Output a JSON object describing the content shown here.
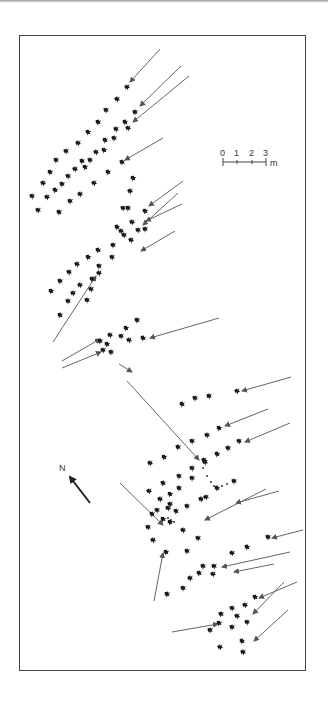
{
  "figure": {
    "type": "trackway-map",
    "colors": {
      "frame": "#444444",
      "track": "#1a1a1a",
      "arrow": "#555555",
      "background": "#ffffff"
    }
  },
  "scale_bar": {
    "ticks": [
      "0",
      "1",
      "2",
      "3"
    ],
    "unit": "m"
  },
  "north_arrow": {
    "label": "N"
  },
  "footprints": [
    [
      127,
      87
    ],
    [
      117,
      99
    ],
    [
      106,
      110
    ],
    [
      98,
      122
    ],
    [
      88,
      132
    ],
    [
      78,
      143
    ],
    [
      66,
      151
    ],
    [
      56,
      160
    ],
    [
      50,
      172
    ],
    [
      43,
      183
    ],
    [
      32,
      196
    ],
    [
      135,
      112
    ],
    [
      125,
      122
    ],
    [
      128,
      128
    ],
    [
      116,
      129
    ],
    [
      114,
      138
    ],
    [
      105,
      140
    ],
    [
      104,
      150
    ],
    [
      96,
      152
    ],
    [
      90,
      160
    ],
    [
      82,
      161
    ],
    [
      85,
      167
    ],
    [
      75,
      169
    ],
    [
      68,
      176
    ],
    [
      62,
      184
    ],
    [
      55,
      190
    ],
    [
      47,
      197
    ],
    [
      38,
      210
    ],
    [
      122,
      162
    ],
    [
      108,
      172
    ],
    [
      94,
      183
    ],
    [
      80,
      194
    ],
    [
      70,
      201
    ],
    [
      59,
      212
    ],
    [
      133,
      178
    ],
    [
      130,
      191
    ],
    [
      123,
      208
    ],
    [
      128,
      208
    ],
    [
      145,
      211
    ],
    [
      132,
      222
    ],
    [
      138,
      230
    ],
    [
      145,
      229
    ],
    [
      117,
      227
    ],
    [
      121,
      231
    ],
    [
      124,
      235
    ],
    [
      113,
      245
    ],
    [
      98,
      250
    ],
    [
      88,
      257
    ],
    [
      77,
      264
    ],
    [
      69,
      272
    ],
    [
      60,
      281
    ],
    [
      51,
      291
    ],
    [
      131,
      240
    ],
    [
      112,
      257
    ],
    [
      99,
      266
    ],
    [
      92,
      279
    ],
    [
      80,
      285
    ],
    [
      73,
      293
    ],
    [
      68,
      301
    ],
    [
      60,
      315
    ],
    [
      99,
      273
    ],
    [
      91,
      289
    ],
    [
      87,
      300
    ],
    [
      137,
      320
    ],
    [
      126,
      328
    ],
    [
      110,
      335
    ],
    [
      121,
      336
    ],
    [
      100,
      341
    ],
    [
      107,
      344
    ],
    [
      129,
      340
    ],
    [
      103,
      350
    ],
    [
      111,
      352
    ],
    [
      143,
      338
    ],
    [
      237,
      391
    ],
    [
      209,
      396
    ],
    [
      195,
      398
    ],
    [
      182,
      404
    ],
    [
      219,
      428
    ],
    [
      207,
      435
    ],
    [
      192,
      441
    ],
    [
      178,
      447
    ],
    [
      164,
      457
    ],
    [
      150,
      463
    ],
    [
      239,
      441
    ],
    [
      228,
      448
    ],
    [
      217,
      454
    ],
    [
      204,
      460
    ],
    [
      192,
      468
    ],
    [
      179,
      476
    ],
    [
      163,
      483
    ],
    [
      149,
      491
    ],
    [
      205,
      462
    ],
    [
      192,
      478
    ],
    [
      179,
      488
    ],
    [
      170,
      494
    ],
    [
      160,
      499
    ],
    [
      157,
      510
    ],
    [
      152,
      514
    ],
    [
      163,
      519
    ],
    [
      168,
      508
    ],
    [
      170,
      504
    ],
    [
      234,
      481
    ],
    [
      217,
      488
    ],
    [
      206,
      497
    ],
    [
      201,
      499
    ],
    [
      187,
      506
    ],
    [
      176,
      511
    ],
    [
      170,
      522
    ],
    [
      183,
      530
    ],
    [
      198,
      538
    ],
    [
      187,
      551
    ],
    [
      166,
      552
    ],
    [
      153,
      540
    ],
    [
      148,
      527
    ],
    [
      268,
      537
    ],
    [
      247,
      547
    ],
    [
      232,
      553
    ],
    [
      214,
      566
    ],
    [
      203,
      566
    ],
    [
      199,
      573
    ],
    [
      213,
      574
    ],
    [
      190,
      578
    ],
    [
      183,
      588
    ],
    [
      167,
      594
    ],
    [
      255,
      597
    ],
    [
      245,
      605
    ],
    [
      232,
      608
    ],
    [
      221,
      614
    ],
    [
      219,
      623
    ],
    [
      237,
      616
    ],
    [
      247,
      622
    ],
    [
      210,
      630
    ],
    [
      242,
      641
    ],
    [
      220,
      647
    ],
    [
      243,
      652
    ],
    [
      232,
      627
    ]
  ],
  "arrows": [
    [
      160,
      49,
      130,
      82
    ],
    [
      181,
      66,
      140,
      106
    ],
    [
      189,
      76,
      133,
      122
    ],
    [
      163,
      138,
      125,
      160
    ],
    [
      183,
      181,
      149,
      206
    ],
    [
      178,
      193,
      143,
      225
    ],
    [
      182,
      204,
      146,
      221
    ],
    [
      175,
      231,
      141,
      251
    ],
    [
      53,
      342,
      96,
      276
    ],
    [
      219,
      318,
      150,
      338
    ],
    [
      62,
      361,
      100,
      339
    ],
    [
      62,
      368,
      101,
      352
    ],
    [
      119,
      364,
      132,
      372
    ],
    [
      127,
      381,
      199,
      460
    ],
    [
      291,
      377,
      242,
      391
    ],
    [
      268,
      409,
      225,
      426
    ],
    [
      290,
      423,
      245,
      442
    ],
    [
      279,
      491,
      236,
      503
    ],
    [
      266,
      489,
      205,
      520
    ],
    [
      120,
      483,
      163,
      525
    ],
    [
      303,
      530,
      272,
      538
    ],
    [
      290,
      552,
      222,
      567
    ],
    [
      274,
      564,
      234,
      572
    ],
    [
      154,
      601,
      163,
      553
    ],
    [
      297,
      582,
      259,
      598
    ],
    [
      284,
      582,
      253,
      614
    ],
    [
      172,
      632,
      218,
      624
    ],
    [
      288,
      610,
      254,
      641
    ]
  ],
  "dotted_paths": [
    [
      [
        203,
        468
      ],
      [
        207,
        476
      ],
      [
        211,
        482
      ],
      [
        214,
        486
      ],
      [
        217,
        488
      ],
      [
        222,
        486
      ],
      [
        227,
        484
      ]
    ],
    [
      [
        168,
        518
      ],
      [
        171,
        520
      ],
      [
        174,
        522
      ]
    ]
  ]
}
